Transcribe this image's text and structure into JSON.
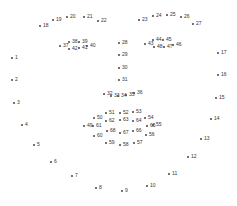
{
  "diagram": {
    "type": "facial-landmarks",
    "dot_color": "#444444",
    "label_color": "#333333",
    "points": [
      {
        "n": "1",
        "x": 12,
        "y": 58
      },
      {
        "n": "2",
        "x": 12,
        "y": 80
      },
      {
        "n": "3",
        "x": 14,
        "y": 103
      },
      {
        "n": "4",
        "x": 22,
        "y": 125
      },
      {
        "n": "5",
        "x": 34,
        "y": 145
      },
      {
        "n": "6",
        "x": 51,
        "y": 162
      },
      {
        "n": "7",
        "x": 72,
        "y": 176
      },
      {
        "n": "8",
        "x": 96,
        "y": 188
      },
      {
        "n": "9",
        "x": 122,
        "y": 191
      },
      {
        "n": "10",
        "x": 147,
        "y": 186
      },
      {
        "n": "11",
        "x": 169,
        "y": 174
      },
      {
        "n": "12",
        "x": 188,
        "y": 157
      },
      {
        "n": "13",
        "x": 201,
        "y": 139
      },
      {
        "n": "14",
        "x": 211,
        "y": 119
      },
      {
        "n": "15",
        "x": 216,
        "y": 98
      },
      {
        "n": "16",
        "x": 218,
        "y": 75
      },
      {
        "n": "17",
        "x": 218,
        "y": 53
      },
      {
        "n": "18",
        "x": 40,
        "y": 26
      },
      {
        "n": "19",
        "x": 53,
        "y": 20
      },
      {
        "n": "20",
        "x": 67,
        "y": 17
      },
      {
        "n": "21",
        "x": 84,
        "y": 17
      },
      {
        "n": "22",
        "x": 98,
        "y": 21
      },
      {
        "n": "23",
        "x": 139,
        "y": 20
      },
      {
        "n": "24",
        "x": 153,
        "y": 16
      },
      {
        "n": "25",
        "x": 167,
        "y": 15
      },
      {
        "n": "26",
        "x": 181,
        "y": 17
      },
      {
        "n": "27",
        "x": 193,
        "y": 24
      },
      {
        "n": "28",
        "x": 119,
        "y": 43
      },
      {
        "n": "29",
        "x": 119,
        "y": 55
      },
      {
        "n": "30",
        "x": 119,
        "y": 68
      },
      {
        "n": "31",
        "x": 119,
        "y": 80
      },
      {
        "n": "32",
        "x": 104,
        "y": 94
      },
      {
        "n": "33",
        "x": 111,
        "y": 96
      },
      {
        "n": "34",
        "x": 118,
        "y": 96
      },
      {
        "n": "35",
        "x": 126,
        "y": 95
      },
      {
        "n": "36",
        "x": 134,
        "y": 93
      },
      {
        "n": "37",
        "x": 60,
        "y": 46
      },
      {
        "n": "38",
        "x": 69,
        "y": 42
      },
      {
        "n": "39",
        "x": 79,
        "y": 42
      },
      {
        "n": "40",
        "x": 87,
        "y": 46
      },
      {
        "n": "41",
        "x": 79,
        "y": 48
      },
      {
        "n": "42",
        "x": 69,
        "y": 49
      },
      {
        "n": "43",
        "x": 145,
        "y": 44
      },
      {
        "n": "44",
        "x": 153,
        "y": 40
      },
      {
        "n": "45",
        "x": 163,
        "y": 40
      },
      {
        "n": "46",
        "x": 173,
        "y": 45
      },
      {
        "n": "47",
        "x": 164,
        "y": 47
      },
      {
        "n": "48",
        "x": 154,
        "y": 47
      },
      {
        "n": "49",
        "x": 84,
        "y": 126
      },
      {
        "n": "50",
        "x": 94,
        "y": 118
      },
      {
        "n": "51",
        "x": 106,
        "y": 113
      },
      {
        "n": "52",
        "x": 120,
        "y": 113
      },
      {
        "n": "53",
        "x": 133,
        "y": 112
      },
      {
        "n": "54",
        "x": 145,
        "y": 118
      },
      {
        "n": "55",
        "x": 153,
        "y": 125
      },
      {
        "n": "56",
        "x": 146,
        "y": 135
      },
      {
        "n": "57",
        "x": 134,
        "y": 143
      },
      {
        "n": "58",
        "x": 120,
        "y": 145
      },
      {
        "n": "59",
        "x": 106,
        "y": 143
      },
      {
        "n": "60",
        "x": 94,
        "y": 136
      },
      {
        "n": "61",
        "x": 93,
        "y": 126
      },
      {
        "n": "62",
        "x": 106,
        "y": 121
      },
      {
        "n": "63",
        "x": 120,
        "y": 120
      },
      {
        "n": "64",
        "x": 133,
        "y": 121
      },
      {
        "n": "65",
        "x": 147,
        "y": 126
      },
      {
        "n": "66",
        "x": 133,
        "y": 131
      },
      {
        "n": "67",
        "x": 120,
        "y": 133
      },
      {
        "n": "68",
        "x": 107,
        "y": 131
      }
    ]
  }
}
